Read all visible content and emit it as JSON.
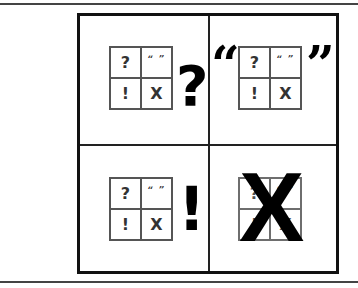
{
  "figure": {
    "grid_cells": [
      "?",
      "“ ”",
      "!",
      "X"
    ],
    "panels": [
      {
        "position": "top-left",
        "highlight": "?",
        "highlight_name": "question-mark"
      },
      {
        "position": "top-right",
        "highlight_open": "“",
        "highlight_close": "”",
        "highlight_name": "quotation-marks"
      },
      {
        "position": "bottom-left",
        "highlight": "!",
        "highlight_name": "exclamation-mark"
      },
      {
        "position": "bottom-right",
        "highlight": "X",
        "highlight_name": "x-mark"
      }
    ]
  }
}
